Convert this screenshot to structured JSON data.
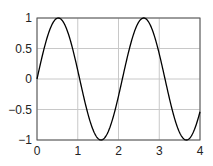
{
  "chart_data": {
    "type": "line",
    "title": "",
    "xlabel": "",
    "ylabel": "",
    "xlim": [
      0,
      4
    ],
    "ylim": [
      -1,
      1
    ],
    "grid": true,
    "xticks": [
      "0",
      "1",
      "2",
      "3",
      "4"
    ],
    "yticks": [
      "1",
      "0.5",
      "0",
      "-0.5",
      "-1"
    ],
    "series": [
      {
        "name": "sin(3x)",
        "function": "y = sin(3x)",
        "x": [
          0,
          0.25,
          0.5236,
          0.75,
          1.0472,
          1.25,
          1.5708,
          1.75,
          2.0944,
          2.25,
          2.618,
          2.75,
          3.1416,
          3.25,
          3.6652,
          3.75,
          4.0
        ],
        "values": [
          0,
          0.68,
          1,
          0.78,
          0,
          -0.57,
          -1,
          -0.86,
          0,
          0.45,
          1,
          0.92,
          0,
          -0.31,
          -1,
          -0.98,
          -0.54
        ],
        "color": "#000000"
      }
    ]
  },
  "axes": {
    "x_tick_labels": [
      "0",
      "1",
      "2",
      "3",
      "4"
    ],
    "y_tick_labels": [
      "1",
      "0.5",
      "0",
      "−0.5",
      "−1"
    ]
  }
}
